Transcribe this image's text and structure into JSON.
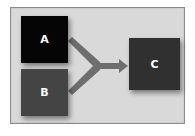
{
  "diagram": {
    "type": "merge-flow",
    "nodes": [
      {
        "id": "A",
        "label": "A",
        "color": "#050505"
      },
      {
        "id": "B",
        "label": "B",
        "color": "#444444"
      },
      {
        "id": "C",
        "label": "C",
        "color": "#303030"
      }
    ],
    "edges": [
      {
        "from": "A",
        "to": "C",
        "merged": true
      },
      {
        "from": "B",
        "to": "C",
        "merged": true
      }
    ],
    "arrow_color": "#6e6e6e",
    "background_color": "#d9d9d9"
  }
}
